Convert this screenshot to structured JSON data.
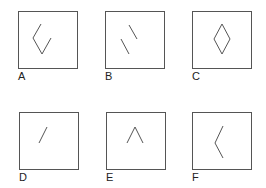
{
  "figure": {
    "stroke_color": "#555555",
    "panels": [
      {
        "label": "A",
        "shape": "open-diamond-left-chevron-with-right-lower-stroke",
        "x": 18,
        "y": 11
      },
      {
        "label": "B",
        "shape": "two-parallel-diagonal-strokes",
        "x": 105,
        "y": 11
      },
      {
        "label": "C",
        "shape": "closed-diamond",
        "x": 192,
        "y": 11
      },
      {
        "label": "D",
        "shape": "single-diagonal-stroke",
        "x": 19,
        "y": 112
      },
      {
        "label": "E",
        "shape": "caret-up",
        "x": 106,
        "y": 112
      },
      {
        "label": "F",
        "shape": "left-chevron",
        "x": 192,
        "y": 112
      }
    ]
  }
}
